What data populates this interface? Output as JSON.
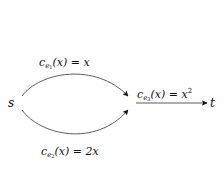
{
  "diagram": {
    "type": "network-flow",
    "nodes": [
      {
        "id": "s",
        "label": "s"
      },
      {
        "id": "t",
        "label": "t"
      }
    ],
    "edges": [
      {
        "id": "e1",
        "from": "s",
        "to": "merge",
        "shape": "upper-arc",
        "label": {
          "c": "c",
          "sub_e": "e",
          "sub_i": "1",
          "arg": "(x)",
          "eq": " = ",
          "rhs": "x"
        }
      },
      {
        "id": "e2",
        "from": "s",
        "to": "merge",
        "shape": "lower-arc",
        "label": {
          "c": "c",
          "sub_e": "e",
          "sub_i": "2",
          "arg": "(x)",
          "eq": " = ",
          "rhs": "2x"
        }
      },
      {
        "id": "e3",
        "from": "merge",
        "to": "t",
        "shape": "straight",
        "label": {
          "c": "c",
          "sub_e": "e",
          "sub_i": "3",
          "arg": "(x)",
          "eq": " = ",
          "rhs": "x",
          "sup": "2"
        }
      }
    ],
    "colors": {
      "stroke": "#333333",
      "text": "#111111",
      "background": "#ffffff"
    }
  }
}
